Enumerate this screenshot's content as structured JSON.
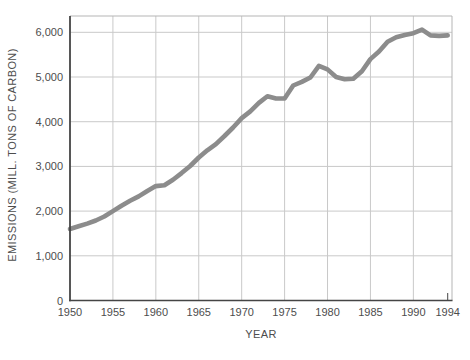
{
  "chart_data": {
    "type": "line",
    "x": [
      1950,
      1951,
      1952,
      1953,
      1954,
      1955,
      1956,
      1957,
      1958,
      1959,
      1960,
      1961,
      1962,
      1963,
      1964,
      1965,
      1966,
      1967,
      1968,
      1969,
      1970,
      1971,
      1972,
      1973,
      1974,
      1975,
      1976,
      1977,
      1978,
      1979,
      1980,
      1981,
      1982,
      1983,
      1984,
      1985,
      1986,
      1987,
      1988,
      1989,
      1990,
      1991,
      1992,
      1993,
      1994
    ],
    "values": [
      1600,
      1660,
      1720,
      1790,
      1880,
      2000,
      2120,
      2230,
      2330,
      2450,
      2560,
      2580,
      2700,
      2850,
      3010,
      3200,
      3360,
      3500,
      3680,
      3870,
      4080,
      4230,
      4420,
      4570,
      4520,
      4520,
      4810,
      4890,
      4990,
      5250,
      5170,
      5000,
      4950,
      4960,
      5130,
      5400,
      5570,
      5790,
      5890,
      5940,
      5980,
      6060,
      5930,
      5920,
      5930
    ],
    "title": "",
    "xlabel": "YEAR",
    "ylabel": "EMISSIONS (MILL. TONS OF CARBON)",
    "xlim": [
      1950,
      1994.5
    ],
    "ylim": [
      0,
      6365
    ],
    "xticks": [
      {
        "value": 1950,
        "label": "1950"
      },
      {
        "value": 1955,
        "label": "1955"
      },
      {
        "value": 1960,
        "label": "1960"
      },
      {
        "value": 1965,
        "label": "1965"
      },
      {
        "value": 1970,
        "label": "1970"
      },
      {
        "value": 1975,
        "label": "1975"
      },
      {
        "value": 1980,
        "label": "1980"
      },
      {
        "value": 1985,
        "label": "1985"
      },
      {
        "value": 1990,
        "label": "1990"
      },
      {
        "value": 1994,
        "label": "1994"
      }
    ],
    "x_gridlines": [
      1955,
      1960,
      1965,
      1970,
      1975,
      1980,
      1985,
      1990
    ],
    "yticks": [
      {
        "value": 0,
        "label": "0"
      },
      {
        "value": 1000,
        "label": "1,000"
      },
      {
        "value": 2000,
        "label": "2,000"
      },
      {
        "value": 3000,
        "label": "3,000"
      },
      {
        "value": 4000,
        "label": "4,000"
      },
      {
        "value": 5000,
        "label": "5,000"
      },
      {
        "value": 6000,
        "label": "6,000"
      }
    ],
    "grid": true,
    "legend": "none",
    "colors": {
      "line": "#8c8c8c",
      "grid": "#c9c9c9",
      "plot_border": "#b5b5b5",
      "axis": "#454545",
      "text": "#4d4d4d",
      "background": "#ffffff"
    }
  }
}
